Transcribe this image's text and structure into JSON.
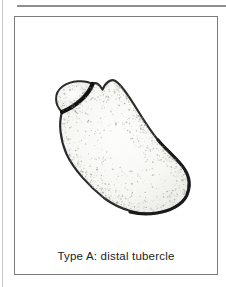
{
  "figure": {
    "caption": "Type A: distal tubercle"
  },
  "colors": {
    "outline": "#2a2a2a",
    "outline_heavy": "#1a1a1a",
    "fracture_line": "#111111",
    "stipple": "#8d8d84",
    "bone_fill_light": "#fdfdfc",
    "bone_fill_mid": "#f6f6f3",
    "bone_fill_edge": "#e7e7e2",
    "box_border": "#7c7c7c",
    "top_rule": "#8f8f8f",
    "page_edge_line": "#c6c6c6",
    "caption_color": "#1c1c1c"
  }
}
